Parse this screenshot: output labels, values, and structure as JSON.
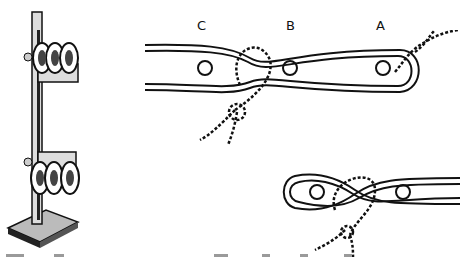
{
  "figure": {
    "labels": {
      "c": "C",
      "b": "B",
      "a": "A"
    },
    "colors": {
      "ink": "#111111",
      "paper": "#ffffff",
      "shade": "#777777"
    }
  }
}
